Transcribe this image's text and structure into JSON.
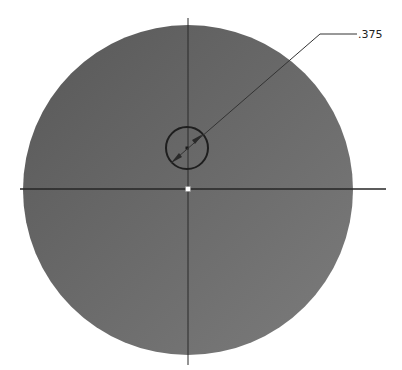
{
  "drawing": {
    "part": {
      "shape": "circular-plate",
      "center": [
        188,
        190
      ],
      "radius": 165,
      "fill_dark": "#5a5a5a",
      "fill_mid": "#6c6c6c",
      "fill_light": "#7c7c7c"
    },
    "hole": {
      "center": [
        187,
        148
      ],
      "radius": 21,
      "stroke": "#1e1e1e"
    },
    "centerlines": {
      "horizontal": {
        "x1": 20,
        "x2": 386,
        "y": 189
      },
      "vertical": {
        "x": 188,
        "y1": 18,
        "y2": 365
      },
      "origin_marker_color": "#ffffff"
    },
    "dimension": {
      "label": ".375",
      "leader_points": [
        [
          171,
          163
        ],
        [
          320,
          34
        ],
        [
          357,
          34
        ]
      ],
      "label_position": [
        358,
        38
      ]
    }
  }
}
